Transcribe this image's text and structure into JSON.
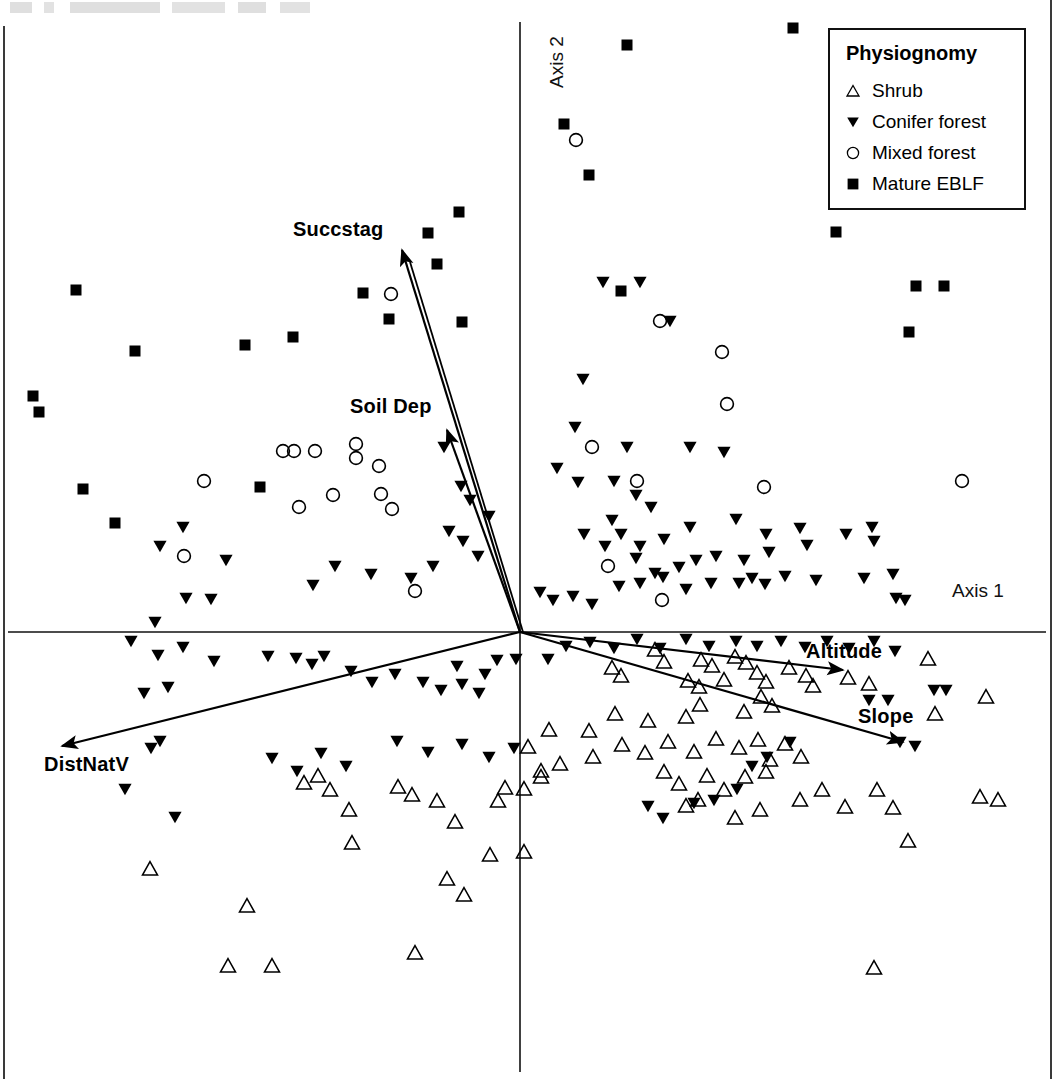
{
  "figure": {
    "type": "ordination-biplot",
    "axis1_label": "Axis 1",
    "axis2_label": "Axis 2",
    "origin_x": 520,
    "origin_y": 632
  },
  "legend": {
    "title": "Physiognomy",
    "entries": [
      {
        "label": "Shrub",
        "symbol": "open-triangle-up"
      },
      {
        "label": "Conifer forest",
        "symbol": "filled-triangle-down"
      },
      {
        "label": "Mixed forest",
        "symbol": "open-circle"
      },
      {
        "label": "Mature EBLF",
        "symbol": "filled-square"
      }
    ]
  },
  "vectors": [
    {
      "label": "Succstag",
      "x1": 520,
      "y1": 632,
      "x2": 402,
      "y2": 250
    },
    {
      "label": "Soil Dep",
      "x1": 520,
      "y1": 632,
      "x2": 447,
      "y2": 430
    },
    {
      "label": "Altitude",
      "x1": 520,
      "y1": 632,
      "x2": 843,
      "y2": 670
    },
    {
      "label": "Slope",
      "x1": 520,
      "y1": 632,
      "x2": 903,
      "y2": 742
    },
    {
      "label": "DistNatV",
      "x1": 520,
      "y1": 632,
      "x2": 62,
      "y2": 746
    }
  ],
  "chart_data": {
    "type": "scatter",
    "title": "",
    "xlabel": "Axis 1",
    "ylabel": "Axis 2",
    "grid": false,
    "legend_position": "top-right",
    "axis_origin_px": [
      520,
      632
    ],
    "plot_area_px": {
      "x": 8,
      "y": 22,
      "width": 1038,
      "height": 1050
    },
    "series": [
      {
        "name": "Shrub",
        "marker": "open-triangle-up",
        "points_px": [
          [
            655,
            650
          ],
          [
            612,
            668
          ],
          [
            621,
            676
          ],
          [
            664,
            662
          ],
          [
            701,
            660
          ],
          [
            712,
            666
          ],
          [
            735,
            657
          ],
          [
            746,
            663
          ],
          [
            688,
            681
          ],
          [
            699,
            687
          ],
          [
            724,
            680
          ],
          [
            757,
            673
          ],
          [
            766,
            682
          ],
          [
            789,
            668
          ],
          [
            806,
            676
          ],
          [
            813,
            686
          ],
          [
            848,
            678
          ],
          [
            869,
            684
          ],
          [
            928,
            659
          ],
          [
            935,
            714
          ],
          [
            986,
            697
          ],
          [
            980,
            797
          ],
          [
            998,
            800
          ],
          [
            761,
            697
          ],
          [
            772,
            706
          ],
          [
            744,
            712
          ],
          [
            700,
            705
          ],
          [
            686,
            717
          ],
          [
            648,
            721
          ],
          [
            615,
            714
          ],
          [
            589,
            731
          ],
          [
            549,
            730
          ],
          [
            528,
            747
          ],
          [
            541,
            771
          ],
          [
            560,
            764
          ],
          [
            593,
            757
          ],
          [
            622,
            745
          ],
          [
            645,
            753
          ],
          [
            668,
            742
          ],
          [
            694,
            752
          ],
          [
            716,
            739
          ],
          [
            739,
            748
          ],
          [
            758,
            740
          ],
          [
            770,
            760
          ],
          [
            785,
            744
          ],
          [
            801,
            757
          ],
          [
            664,
            772
          ],
          [
            679,
            784
          ],
          [
            707,
            776
          ],
          [
            698,
            800
          ],
          [
            724,
            790
          ],
          [
            745,
            777
          ],
          [
            766,
            772
          ],
          [
            686,
            806
          ],
          [
            735,
            818
          ],
          [
            760,
            810
          ],
          [
            800,
            800
          ],
          [
            822,
            790
          ],
          [
            845,
            807
          ],
          [
            877,
            790
          ],
          [
            893,
            808
          ],
          [
            304,
            783
          ],
          [
            318,
            776
          ],
          [
            330,
            790
          ],
          [
            349,
            810
          ],
          [
            352,
            843
          ],
          [
            398,
            787
          ],
          [
            412,
            795
          ],
          [
            437,
            801
          ],
          [
            455,
            822
          ],
          [
            498,
            801
          ],
          [
            505,
            788
          ],
          [
            524,
            789
          ],
          [
            541,
            777
          ],
          [
            490,
            855
          ],
          [
            524,
            852
          ],
          [
            464,
            895
          ],
          [
            447,
            879
          ],
          [
            415,
            953
          ],
          [
            228,
            966
          ],
          [
            272,
            966
          ],
          [
            150,
            869
          ],
          [
            247,
            906
          ],
          [
            874,
            968
          ],
          [
            908,
            841
          ]
        ]
      },
      {
        "name": "Conifer forest",
        "marker": "filled-triangle-down",
        "points_px": [
          [
            603,
            282
          ],
          [
            640,
            282
          ],
          [
            670,
            321
          ],
          [
            583,
            379
          ],
          [
            575,
            427
          ],
          [
            627,
            447
          ],
          [
            690,
            447
          ],
          [
            724,
            452
          ],
          [
            557,
            468
          ],
          [
            578,
            482
          ],
          [
            614,
            481
          ],
          [
            636,
            495
          ],
          [
            651,
            507
          ],
          [
            612,
            520
          ],
          [
            584,
            534
          ],
          [
            605,
            546
          ],
          [
            621,
            534
          ],
          [
            640,
            546
          ],
          [
            636,
            558
          ],
          [
            664,
            539
          ],
          [
            690,
            527
          ],
          [
            736,
            519
          ],
          [
            766,
            534
          ],
          [
            800,
            528
          ],
          [
            846,
            534
          ],
          [
            872,
            527
          ],
          [
            874,
            541
          ],
          [
            807,
            545
          ],
          [
            769,
            552
          ],
          [
            744,
            560
          ],
          [
            716,
            556
          ],
          [
            696,
            560
          ],
          [
            679,
            567
          ],
          [
            655,
            573
          ],
          [
            663,
            577
          ],
          [
            619,
            586
          ],
          [
            640,
            583
          ],
          [
            573,
            596
          ],
          [
            592,
            604
          ],
          [
            686,
            589
          ],
          [
            711,
            583
          ],
          [
            739,
            583
          ],
          [
            752,
            578
          ],
          [
            765,
            584
          ],
          [
            785,
            576
          ],
          [
            816,
            580
          ],
          [
            864,
            578
          ],
          [
            893,
            574
          ],
          [
            896,
            598
          ],
          [
            905,
            600
          ],
          [
            553,
            600
          ],
          [
            540,
            592
          ],
          [
            444,
            447
          ],
          [
            461,
            486
          ],
          [
            470,
            500
          ],
          [
            489,
            516
          ],
          [
            449,
            531
          ],
          [
            463,
            541
          ],
          [
            478,
            556
          ],
          [
            433,
            566
          ],
          [
            411,
            578
          ],
          [
            371,
            574
          ],
          [
            335,
            566
          ],
          [
            313,
            585
          ],
          [
            226,
            560
          ],
          [
            183,
            527
          ],
          [
            160,
            546
          ],
          [
            186,
            598
          ],
          [
            211,
            599
          ],
          [
            155,
            622
          ],
          [
            131,
            641
          ],
          [
            158,
            655
          ],
          [
            183,
            647
          ],
          [
            214,
            661
          ],
          [
            268,
            656
          ],
          [
            296,
            658
          ],
          [
            312,
            664
          ],
          [
            324,
            656
          ],
          [
            351,
            671
          ],
          [
            372,
            682
          ],
          [
            395,
            674
          ],
          [
            423,
            682
          ],
          [
            441,
            690
          ],
          [
            462,
            684
          ],
          [
            485,
            674
          ],
          [
            497,
            660
          ],
          [
            457,
            666
          ],
          [
            479,
            693
          ],
          [
            516,
            659
          ],
          [
            548,
            659
          ],
          [
            566,
            646
          ],
          [
            590,
            642
          ],
          [
            614,
            648
          ],
          [
            637,
            639
          ],
          [
            660,
            648
          ],
          [
            686,
            639
          ],
          [
            709,
            646
          ],
          [
            736,
            641
          ],
          [
            757,
            646
          ],
          [
            781,
            641
          ],
          [
            805,
            647
          ],
          [
            827,
            641
          ],
          [
            849,
            648
          ],
          [
            874,
            641
          ],
          [
            895,
            651
          ],
          [
            144,
            693
          ],
          [
            168,
            687
          ],
          [
            160,
            741
          ],
          [
            151,
            748
          ],
          [
            125,
            789
          ],
          [
            175,
            817
          ],
          [
            272,
            758
          ],
          [
            297,
            771
          ],
          [
            321,
            753
          ],
          [
            346,
            766
          ],
          [
            397,
            741
          ],
          [
            428,
            752
          ],
          [
            462,
            744
          ],
          [
            489,
            757
          ],
          [
            514,
            748
          ],
          [
            648,
            806
          ],
          [
            663,
            818
          ],
          [
            694,
            803
          ],
          [
            714,
            800
          ],
          [
            737,
            789
          ],
          [
            752,
            766
          ],
          [
            767,
            757
          ],
          [
            790,
            742
          ],
          [
            900,
            742
          ],
          [
            915,
            746
          ],
          [
            869,
            700
          ],
          [
            888,
            700
          ],
          [
            934,
            690
          ],
          [
            946,
            690
          ]
        ]
      },
      {
        "name": "Mixed forest",
        "marker": "open-circle",
        "points_px": [
          [
            576,
            140
          ],
          [
            660,
            321
          ],
          [
            722,
            352
          ],
          [
            727,
            404
          ],
          [
            764,
            487
          ],
          [
            962,
            481
          ],
          [
            592,
            447
          ],
          [
            637,
            481
          ],
          [
            608,
            566
          ],
          [
            662,
            600
          ],
          [
            391,
            294
          ],
          [
            283,
            451
          ],
          [
            294,
            451
          ],
          [
            315,
            451
          ],
          [
            356,
            444
          ],
          [
            356,
            458
          ],
          [
            379,
            466
          ],
          [
            381,
            494
          ],
          [
            392,
            509
          ],
          [
            333,
            495
          ],
          [
            299,
            507
          ],
          [
            204,
            481
          ],
          [
            184,
            556
          ],
          [
            415,
            591
          ]
        ]
      },
      {
        "name": "Mature EBLF",
        "marker": "filled-square",
        "points_px": [
          [
            793,
            28
          ],
          [
            627,
            45
          ],
          [
            564,
            124
          ],
          [
            589,
            175
          ],
          [
            459,
            212
          ],
          [
            428,
            233
          ],
          [
            437,
            264
          ],
          [
            621,
            291
          ],
          [
            389,
            319
          ],
          [
            462,
            322
          ],
          [
            76,
            290
          ],
          [
            135,
            351
          ],
          [
            245,
            345
          ],
          [
            293,
            337
          ],
          [
            363,
            293
          ],
          [
            33,
            396
          ],
          [
            39,
            412
          ],
          [
            836,
            232
          ],
          [
            916,
            286
          ],
          [
            944,
            286
          ],
          [
            909,
            332
          ],
          [
            83,
            489
          ],
          [
            260,
            487
          ],
          [
            115,
            523
          ]
        ]
      }
    ]
  }
}
